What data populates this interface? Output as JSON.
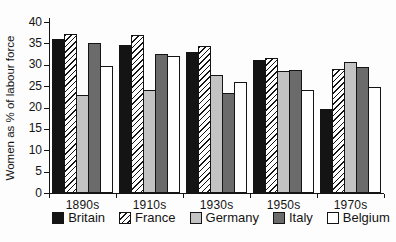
{
  "chart_data": {
    "type": "bar",
    "title": "",
    "ylabel": "Women as % of labour force",
    "xlabel": "",
    "categories": [
      "1890s",
      "1910s",
      "1930s",
      "1950s",
      "1970s"
    ],
    "series": [
      {
        "name": "Britain",
        "fill": "black",
        "color": "#141414",
        "values": [
          36.0,
          34.6,
          33.0,
          31.0,
          19.6
        ]
      },
      {
        "name": "France",
        "fill": "hatch",
        "color": "#ffffff",
        "pattern": "diagonal-hatch",
        "values": [
          37.2,
          37.0,
          34.5,
          31.6,
          29.0
        ]
      },
      {
        "name": "Germany",
        "fill": "lightgray",
        "color": "#c3c3c3",
        "values": [
          23.0,
          24.0,
          27.5,
          28.5,
          30.6
        ]
      },
      {
        "name": "Italy",
        "fill": "darkgray",
        "color": "#6b6b6b",
        "values": [
          35.0,
          32.5,
          23.5,
          28.7,
          29.4
        ]
      },
      {
        "name": "Belgium",
        "fill": "white",
        "color": "#ffffff",
        "values": [
          29.6,
          32.0,
          25.9,
          24.0,
          24.7
        ]
      }
    ],
    "ylim": [
      0,
      40
    ],
    "yticks": [
      0,
      5,
      10,
      15,
      20,
      25,
      30,
      35,
      40
    ],
    "grid": false,
    "legend_position": "bottom",
    "axis_color": "#141414",
    "background_color": "#fdfdfd"
  }
}
